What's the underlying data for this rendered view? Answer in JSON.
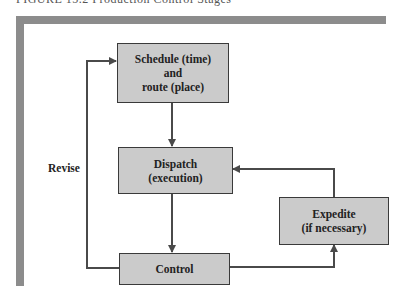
{
  "caption": "FIGURE 15.2  Production Control Stages",
  "nodes": {
    "schedule": {
      "lines": [
        "Schedule (time)",
        "and",
        "route (place)"
      ]
    },
    "dispatch": {
      "lines": [
        "Dispatch",
        "(execution)"
      ]
    },
    "control": {
      "lines": [
        "Control"
      ]
    },
    "expedite": {
      "lines": [
        "Expedite",
        "(if necessary)"
      ]
    }
  },
  "edges": [
    {
      "from": "schedule",
      "to": "dispatch"
    },
    {
      "from": "dispatch",
      "to": "control"
    },
    {
      "from": "control",
      "to": "expedite"
    },
    {
      "from": "expedite",
      "to": "dispatch"
    },
    {
      "from": "control",
      "to": "schedule",
      "label": "Revise"
    }
  ],
  "labels": {
    "revise": "Revise"
  },
  "colors": {
    "frame": "#8c8c8c",
    "box_fill": "#cbcbcb",
    "box_border": "#3a3a3a",
    "line": "#4a4a4a"
  }
}
